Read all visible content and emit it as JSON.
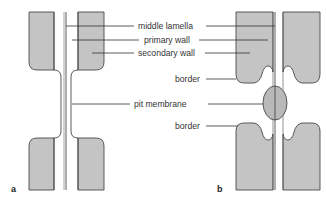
{
  "figure": {
    "panels": [
      {
        "id": "a",
        "label": "a",
        "description": "simple pit pair"
      },
      {
        "id": "b",
        "label": "b",
        "description": "bordered pit pair"
      }
    ],
    "labels": {
      "middle_lamella": "middle lamella",
      "primary_wall": "primary wall",
      "secondary_wall": "secondary wall",
      "border_top": "border",
      "pit_membrane": "pit membrane",
      "border_bottom": "border"
    },
    "colors": {
      "wall_fill": "#c4c4c4",
      "outline": "#4a4a4a",
      "text": "#333333"
    }
  }
}
